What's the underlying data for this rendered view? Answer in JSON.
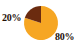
{
  "chart_data": {
    "type": "pie",
    "title": "",
    "subtitle": "",
    "xlabel": "",
    "ylabel": "",
    "grid": false,
    "legend": "none",
    "labels_position": "outside",
    "center": {
      "cx": 41,
      "cy": 23,
      "r": 17
    },
    "start_angle_deg": 0,
    "direction": "clockwise",
    "categories": [
      "80%",
      "20%"
    ],
    "values": [
      80,
      20
    ],
    "slices": [
      {
        "name": "major-slice",
        "label": "80%",
        "value": 80,
        "color": "#F6A623",
        "start_angle_deg": 0,
        "end_angle_deg": 288,
        "label_x": 55,
        "label_y": 31
      },
      {
        "name": "minor-slice",
        "label": "20%",
        "value": 20,
        "color": "#6B2B0F",
        "start_angle_deg": 288,
        "end_angle_deg": 360,
        "label_x": 2,
        "label_y": 12
      }
    ],
    "annotations": [
      {
        "text": "20%",
        "x": 2,
        "y": 12
      },
      {
        "text": "80%",
        "x": 55,
        "y": 31
      }
    ],
    "colors": {
      "major": "#F6A623",
      "minor": "#6B2B0F",
      "background": "#FFFFFF",
      "label_text": "#241008"
    }
  }
}
